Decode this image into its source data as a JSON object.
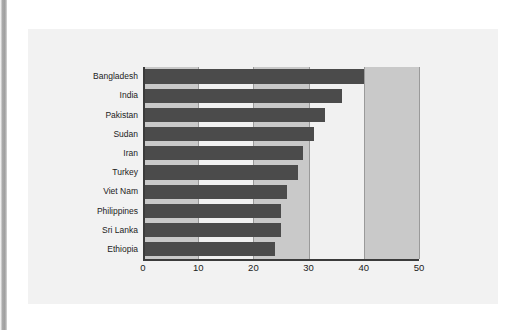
{
  "figure": {
    "panel_background": "#f2f2f2",
    "bar_color": "#4b4b4b",
    "band_gray": "#c9c9c9",
    "band_white": "#f1f1f1",
    "axis_color": "#3b3b3b"
  },
  "chart_data": {
    "type": "bar",
    "orientation": "horizontal",
    "title": "",
    "subtitle": "",
    "xlabel": "",
    "ylabel": "",
    "xlim": [
      0,
      50
    ],
    "xticks": [
      0,
      10,
      20,
      30,
      40,
      50
    ],
    "xtick_labels": [
      "0",
      "10",
      "20",
      "30",
      "40",
      "50"
    ],
    "grid": true,
    "legend": "none",
    "categories": [
      "Bangladesh",
      "India",
      "Pakistan",
      "Sudan",
      "Iran",
      "Turkey",
      "Viet Nam",
      "Philippines",
      "Sri Lanka",
      "Ethiopia"
    ],
    "values": [
      40,
      36,
      33,
      31,
      29,
      28,
      26,
      25,
      25,
      24
    ],
    "series": [
      {
        "name": "value",
        "values": [
          40,
          36,
          33,
          31,
          29,
          28,
          26,
          25,
          25,
          24
        ]
      }
    ],
    "bands": [
      {
        "from": 0,
        "to": 10,
        "shade": "gray"
      },
      {
        "from": 10,
        "to": 20,
        "shade": "white"
      },
      {
        "from": 20,
        "to": 30,
        "shade": "gray"
      },
      {
        "from": 30,
        "to": 40,
        "shade": "white"
      },
      {
        "from": 40,
        "to": 50,
        "shade": "gray"
      }
    ]
  }
}
